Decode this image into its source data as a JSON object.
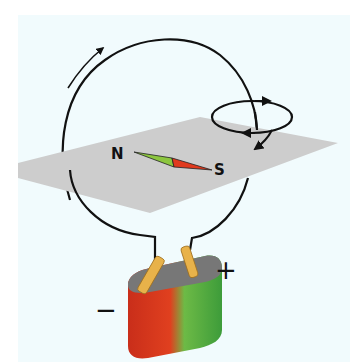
{
  "diagram": {
    "labels": {
      "north": "N",
      "south": "S",
      "positive": "+",
      "negative": "−"
    },
    "colors": {
      "background_panel": "#f1fbfd",
      "plane": "#cfcfcf",
      "wire": "#111111",
      "needle_north": "#8cc63f",
      "needle_south": "#e03a1e",
      "battery_negative": "#d9361f",
      "battery_positive": "#4caf3f",
      "battery_top": "#7a7a7a",
      "terminals": "#e8b24a"
    }
  }
}
